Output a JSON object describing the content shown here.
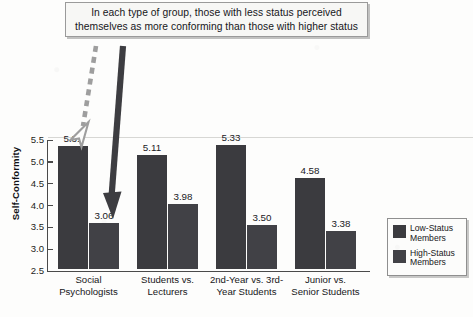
{
  "annotation": {
    "name": "callout-box",
    "lines": [
      "In each type of group, those with less status perceived",
      "themselves as more conforming than those with higher status"
    ]
  },
  "axis": {
    "y_title": "Self-Conformity",
    "y_ticks": [
      "5.5",
      "5.0",
      "4.5",
      "4.0",
      "3.5",
      "3.0",
      "2.5"
    ]
  },
  "legend": {
    "items": [
      {
        "label_line1": "Low-Status",
        "label_line2": "Members",
        "color": "#3b3b3f"
      },
      {
        "label_line1": "High-Status",
        "label_line2": "Members",
        "color": "#414146"
      }
    ]
  },
  "arrows": {
    "dashed_arrow_name": "dashed-arrow-to-low-status-bar",
    "solid_arrow_name": "solid-arrow-to-high-status-bar"
  },
  "chart_data": {
    "type": "bar",
    "title": "",
    "xlabel": "",
    "ylabel": "Self-Conformity",
    "ylim": [
      2.5,
      5.5
    ],
    "ytick_step": 0.5,
    "grid": false,
    "legend_position": "right",
    "categories": [
      "Social Psychologists",
      "Students vs. Lecturers",
      "2nd-Year vs. 3rd-Year Students",
      "Junior vs. Senior Students"
    ],
    "category_lines": [
      [
        "Social",
        "Psychologists"
      ],
      [
        "Students vs.",
        "Lecturers"
      ],
      [
        "2nd-Year vs. 3rd-",
        "Year Students"
      ],
      [
        "Junior vs.",
        "Senior Students"
      ]
    ],
    "series": [
      {
        "name": "Low-Status Members",
        "values": [
          5.31,
          5.11,
          5.33,
          4.58
        ],
        "color": "#3b3b3f"
      },
      {
        "name": "High-Status Members",
        "values": [
          3.06,
          3.98,
          3.5,
          3.38
        ],
        "color": "#414146"
      }
    ],
    "value_labels": [
      [
        "5.31",
        "3.06"
      ],
      [
        "5.11",
        "3.98"
      ],
      [
        "5.33",
        "3.50"
      ],
      [
        "4.58",
        "3.38"
      ]
    ]
  }
}
